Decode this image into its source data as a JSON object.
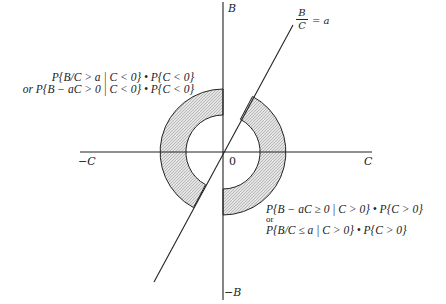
{
  "axes": {
    "b_pos_label": "B",
    "b_neg_label": "−B",
    "c_pos_label": "C",
    "c_neg_label": "−C",
    "origin_label": "0"
  },
  "line": {
    "label_numerator": "B",
    "label_denominator": "C",
    "label_rhs": "= a"
  },
  "annotations": {
    "upper_left": {
      "line1": "P{B/C > a | C < 0} • P{C < 0}",
      "line2": "or P{B − aC > 0 | C < 0} • P{C < 0}"
    },
    "lower_right": {
      "line1": "P{B − aC ≥ 0 | C > 0} • P{C > 0}",
      "line2": "or",
      "line3": "P{B/C ≤ a | C > 0} • P{C > 0}"
    }
  },
  "colors": {
    "ink": "#222222",
    "shade": "#cfcfcf",
    "background": "#ffffff"
  }
}
